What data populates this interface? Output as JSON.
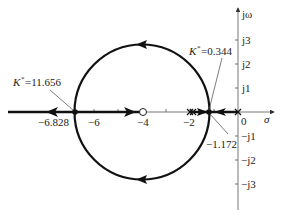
{
  "diagram": {
    "type": "root-locus",
    "axes": {
      "real_axis_label": "σ",
      "imag_axis_label": "jω",
      "real_ticks": [
        {
          "value": -6.828,
          "label": "−6.828"
        },
        {
          "value": -6,
          "label": "−6"
        },
        {
          "value": -4,
          "label": "−4"
        },
        {
          "value": -2,
          "label": "−2"
        },
        {
          "value": 0,
          "label": "0"
        }
      ],
      "imag_ticks": [
        {
          "value": 3,
          "label": "j3"
        },
        {
          "value": 2,
          "label": "j2"
        },
        {
          "value": 1,
          "label": "j1"
        },
        {
          "value": -1,
          "label": "−j1"
        },
        {
          "value": -2,
          "label": "−j2"
        },
        {
          "value": -3,
          "label": "−j3"
        }
      ]
    },
    "poles": [
      0,
      -2,
      -2
    ],
    "zeros": [
      -4
    ],
    "breakaway_points": [
      {
        "value": -6.828,
        "label": "−6.828",
        "gain_label": "K*=11.656"
      },
      {
        "value": -1.172,
        "label": "−1.172",
        "gain_label": "K*=0.344"
      }
    ],
    "circle": {
      "center": -4,
      "radius": 2.828
    },
    "annotations": {
      "gain_left": "=11.656",
      "gain_right": "=0.344",
      "gain_symbol": "K",
      "gain_sup": "*",
      "breakaway_right_value": "−1.172"
    }
  }
}
